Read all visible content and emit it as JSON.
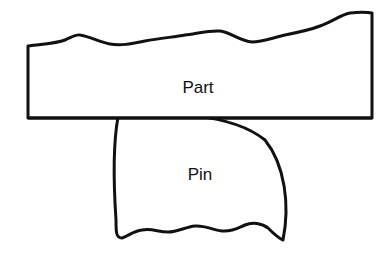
{
  "diagram": {
    "part": {
      "label": "Part"
    },
    "pin": {
      "label": "Pin"
    },
    "colors": {
      "stroke": "#111111",
      "fill": "#ffffff"
    }
  }
}
